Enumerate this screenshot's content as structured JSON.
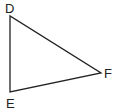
{
  "diagram": {
    "type": "triangle",
    "vertices": [
      {
        "name": "D",
        "x": 10,
        "y": 16,
        "label_x": 5,
        "label_y": 13
      },
      {
        "name": "E",
        "x": 10,
        "y": 92,
        "label_x": 6,
        "label_y": 108
      },
      {
        "name": "F",
        "x": 101,
        "y": 73,
        "label_x": 104,
        "label_y": 78
      }
    ],
    "stroke_color": "#222222"
  }
}
